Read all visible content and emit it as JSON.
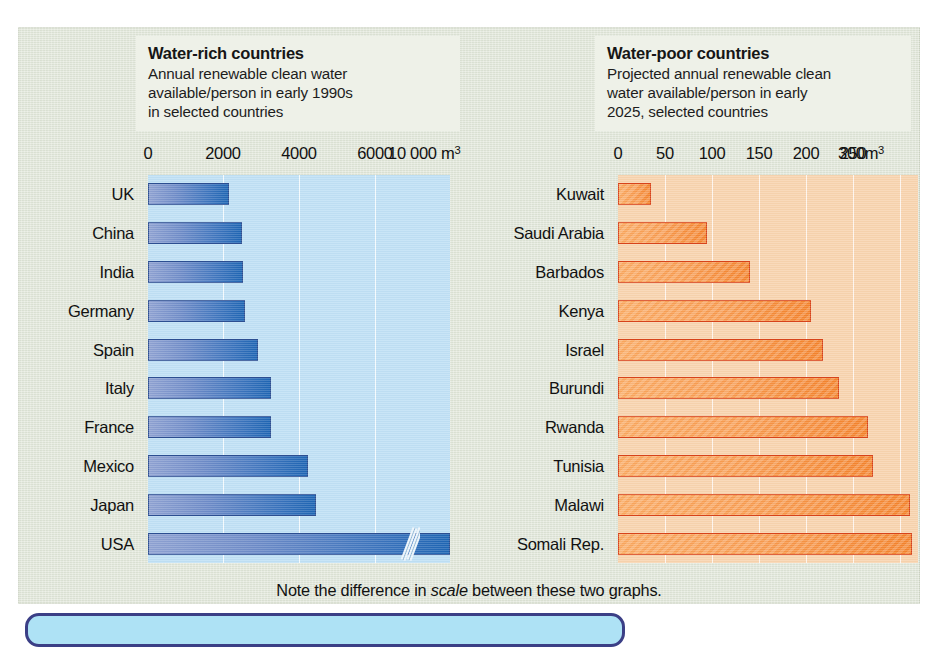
{
  "figure": {
    "note_prefix": "Note the difference in ",
    "note_emphasis": "scale",
    "note_suffix": " between these two graphs.",
    "colors": {
      "page_background": "#ffffff",
      "figure_background": "#dfe5d7",
      "caption_background": "#eef1e8",
      "left_plot_background": "#bfe0f5",
      "right_plot_background": "#f8d3ae",
      "left_bar": "#2f6fba",
      "right_bar": "#f4832c",
      "right_bar_outline": "#d9441a",
      "gridline": "#ffffff",
      "text": "#111111"
    }
  },
  "left_panel": {
    "title": "Water-rich countries",
    "subtitle": "Annual renewable clean water available/person in early 1990s in selected countries",
    "subtitle_lines": [
      "Annual renewable clean water",
      "available/person in early 1990s",
      "in selected countries"
    ],
    "unit_label": "m3",
    "faucet_icon": "faucet-flowing-icon"
  },
  "right_panel": {
    "title": "Water-poor countries",
    "subtitle": "Projected annual renewable clean water available/person in early 2025, selected countries",
    "subtitle_lines": [
      "Projected annual renewable clean",
      "water available/person in early",
      "2025, selected countries"
    ],
    "unit_label": "m3",
    "faucet_icon": "faucet-dripping-icon"
  },
  "chart_data": [
    {
      "id": "water-rich",
      "type": "bar",
      "orientation": "horizontal",
      "title": "Water-rich countries",
      "subtitle": "Annual renewable clean water available/person in early 1990s in selected countries",
      "xlabel": "m3",
      "ylabel": "",
      "unit": "m3 per person per year",
      "xlim": [
        0,
        11000
      ],
      "axis_break": true,
      "axis_break_note": "Axis compressed between 6000 and 10 000; USA bar carries a break slash",
      "grid": true,
      "gridlines_vertical": true,
      "legend": "none",
      "tick_labels": [
        "0",
        "2000",
        "4000",
        "6000",
        "10 000 m3"
      ],
      "tick_values": [
        0,
        2000,
        4000,
        6000,
        10000
      ],
      "tick_px": [
        0,
        75,
        151,
        227,
        302
      ],
      "categories": [
        "UK",
        "China",
        "India",
        "Germany",
        "Spain",
        "Italy",
        "France",
        "Mexico",
        "Japan",
        "USA"
      ],
      "values": [
        1700,
        2100,
        2100,
        2150,
        2500,
        2800,
        2800,
        3800,
        4000,
        10000
      ],
      "bar_px": [
        81,
        94,
        95,
        97,
        110,
        123,
        123,
        160,
        168,
        302
      ]
    },
    {
      "id": "water-poor",
      "type": "bar",
      "orientation": "horizontal",
      "title": "Water-poor countries",
      "subtitle": "Projected annual renewable clean water available/person in early 2025, selected countries",
      "xlabel": "m3",
      "ylabel": "",
      "unit": "m3 per person per year",
      "xlim": [
        0,
        320
      ],
      "axis_break": false,
      "grid": true,
      "gridlines_vertical": true,
      "legend": "none",
      "tick_labels": [
        "0",
        "50",
        "100",
        "150",
        "200",
        "250",
        "300m3"
      ],
      "tick_values": [
        0,
        50,
        100,
        150,
        200,
        250,
        300
      ],
      "tick_px": [
        0,
        47,
        94,
        141,
        188,
        235,
        282
      ],
      "categories": [
        "Kuwait",
        "Saudi Arabia",
        "Barbados",
        "Kenya",
        "Israel",
        "Burundi",
        "Rwanda",
        "Tunisia",
        "Malawi",
        "Somali Rep."
      ],
      "values": [
        35,
        95,
        140,
        205,
        218,
        235,
        266,
        271,
        310,
        313
      ],
      "bar_px": [
        33,
        89,
        132,
        193,
        205,
        221,
        250,
        255,
        292,
        294
      ]
    }
  ]
}
